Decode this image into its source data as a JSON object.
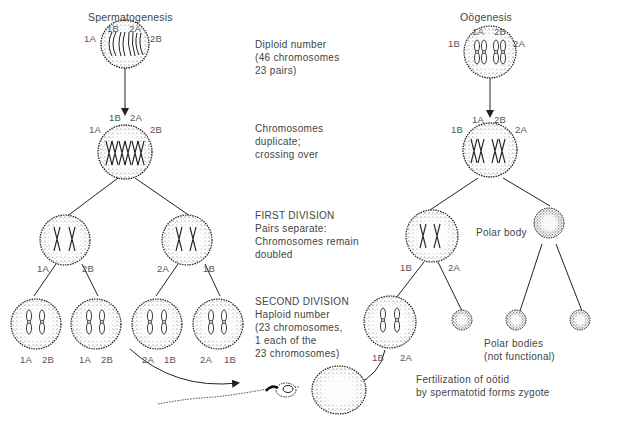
{
  "spermatogenesis": {
    "title": "Spermatogenesis",
    "cell1_labels": {
      "top_left": "1B",
      "top_right": "2A",
      "left": "1A",
      "right": "2B"
    },
    "cell2_labels": {
      "top_left": "1B",
      "top_right": "2A",
      "left": "1A",
      "right": "2B"
    },
    "first_division_labels": [
      {
        "left": "1A",
        "right": "2B"
      },
      {
        "left": "2A",
        "right": "1B"
      }
    ],
    "second_division_labels": [
      {
        "left": "1A",
        "right": "2B"
      },
      {
        "left": "1A",
        "right": "2B"
      },
      {
        "left": "2A",
        "right": "1B"
      },
      {
        "left": "2A",
        "right": "1B"
      }
    ]
  },
  "oogenesis": {
    "title": "Oögenesis",
    "cell1_labels": {
      "top_left": "1A",
      "top_right": "2B",
      "left": "1B",
      "right": "2A"
    },
    "cell2_labels": {
      "top_left": "1A",
      "top_right": "2B",
      "left": "1B",
      "right": "2A"
    },
    "first_division_labels": {
      "left": "1B",
      "right": "2A"
    },
    "second_division_labels": {
      "left": "1B",
      "right": "2A"
    },
    "polar_body_label": "Polar body",
    "polar_bodies_label": [
      "Polar bodies",
      "(not functional)"
    ]
  },
  "stage_notes": {
    "diploid": [
      "Diploid number",
      "(46 chromosomes",
      "23 pairs)"
    ],
    "duplicate": [
      "Chromosomes",
      "duplicate;",
      "crossing over"
    ],
    "first_division": [
      "FIRST DIVISION",
      "Pairs separate:",
      "Chromosomes remain",
      "doubled"
    ],
    "second_division": [
      "SECOND DIVISION",
      "Haploid number",
      "(23 chromosomes,",
      "1 each of the",
      "23 chromosomes)"
    ]
  },
  "fertilization_note": [
    "Fertilization of oötid",
    "by spermatotid forms zygote"
  ],
  "icons": {
    "cell": "stippled-circle-cell",
    "sperm": "sperm-cell",
    "arrow": "arrow-down"
  },
  "colors": {
    "ink": "#222222",
    "text": "#555555",
    "background": "#ffffff"
  }
}
